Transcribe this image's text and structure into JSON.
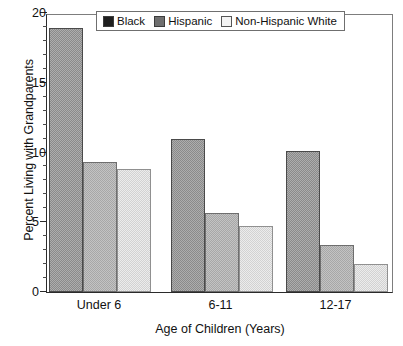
{
  "chart_data": {
    "type": "bar",
    "title": "",
    "xlabel": "Age of Children (Years)",
    "ylabel": "Percent Living with Grandparents",
    "categories": [
      "Under 6",
      "6-11",
      "12-17"
    ],
    "series": [
      {
        "name": "Black",
        "values": [
          18.9,
          11.0,
          10.1
        ],
        "color": "#8a8a8a",
        "legend_swatch": "#1f1f1f"
      },
      {
        "name": "Hispanic",
        "values": [
          9.3,
          5.7,
          3.4
        ],
        "color": "#c3c3c3",
        "legend_swatch": "#6f6f6f"
      },
      {
        "name": "Non-Hispanic White",
        "values": [
          8.8,
          4.7,
          2.0
        ],
        "color": "#ececec",
        "legend_swatch": "#f4f4f4"
      }
    ],
    "ylim": [
      0,
      20
    ],
    "ytick_labels": [
      "0",
      "5",
      "10",
      "15",
      "20"
    ],
    "ytick_values": [
      0,
      5,
      10,
      15,
      20
    ],
    "yminor_step": 1,
    "grid": false,
    "legend_position": "top-center"
  },
  "legend": {
    "items": [
      {
        "label": "Black"
      },
      {
        "label": "Hispanic"
      },
      {
        "label": "Non-Hispanic White"
      }
    ]
  },
  "axes": {
    "y_title": "Percent Living with Grandparents",
    "x_title": "Age of Children (Years)"
  }
}
